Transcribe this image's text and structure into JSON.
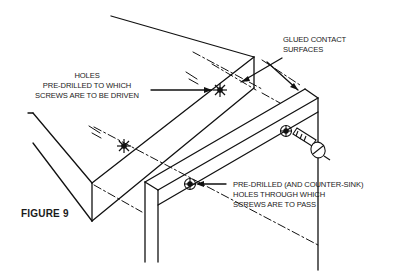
{
  "figure": {
    "title": "FIGURE 9"
  },
  "labels": {
    "holes_driven": {
      "lines": [
        "HOLES",
        "PRE-DRILLED TO WHICH",
        "SCREWS ARE TO BE DRIVEN"
      ]
    },
    "glued_surfaces": {
      "lines": [
        "GLUED CONTACT",
        "SURFACES"
      ]
    },
    "holes_pass": {
      "lines": [
        "PRE-DRILLED (AND COUNTER-SINK)",
        "HOLES THROUGH WHICH",
        "SCREWS ARE TO PASS"
      ]
    }
  },
  "colors": {
    "line": "#111111",
    "background": "#ffffff"
  }
}
